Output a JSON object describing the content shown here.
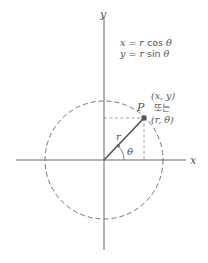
{
  "diagram": {
    "type": "polar-coordinates",
    "axes": {
      "x_label": "x",
      "y_label": "y"
    },
    "equations": {
      "line1": {
        "lhs": "x",
        "eq": " = ",
        "r": "r",
        "func": " cos ",
        "theta": "θ"
      },
      "line2": {
        "lhs": "y",
        "eq": " = ",
        "r": "r",
        "func": " sin ",
        "theta": "θ"
      }
    },
    "point": {
      "label": "P",
      "cartesian": "(x, y)",
      "connector": "또는",
      "polar": "(r, θ)"
    },
    "radius_label": "r",
    "angle_label": "θ",
    "colors": {
      "line": "#555555",
      "dash": "#888888",
      "text": "#555555",
      "background": "#ffffff"
    }
  }
}
